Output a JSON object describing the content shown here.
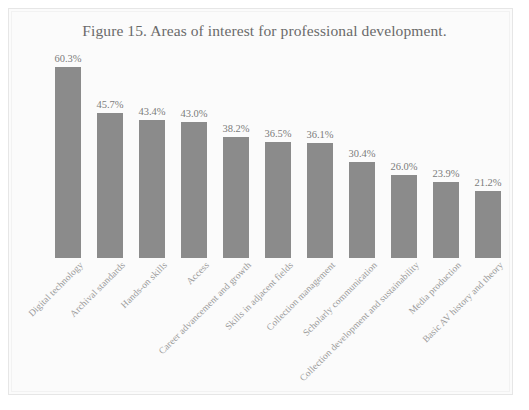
{
  "figure": {
    "title": "Figure 15. Areas of interest for professional development.",
    "background_color": "#fbfbfb",
    "frame_color": "#e6e6e6"
  },
  "chart_data": {
    "type": "bar",
    "title": "Figure 15. Areas of interest for professional development.",
    "xlabel": "",
    "ylabel": "",
    "ylim": [
      0,
      63
    ],
    "grid": false,
    "legend": "none",
    "orientation": "vertical",
    "bar_color": "#8b8b8b",
    "value_suffix": "%",
    "categories": [
      "Digital technology",
      "Archival standards",
      "Hands-on skills",
      "Access",
      "Career advancement and growth",
      "Skills in adjacent fields",
      "Collection management",
      "Scholarly communication",
      "Collection development and sustainability",
      "Media production",
      "Basic AV history and theory"
    ],
    "values": [
      60.3,
      45.7,
      43.4,
      43.0,
      38.2,
      36.5,
      36.1,
      30.4,
      26.0,
      23.9,
      21.2
    ],
    "value_labels": [
      "60.3%",
      "45.7%",
      "43.4%",
      "43.0%",
      "38.2%",
      "36.5%",
      "36.1%",
      "30.4%",
      "26.0%",
      "23.9%",
      "21.2%"
    ]
  }
}
